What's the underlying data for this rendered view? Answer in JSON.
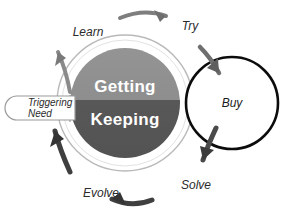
{
  "diagram": {
    "type": "cycle",
    "core": {
      "top_half_label": "Getting",
      "bottom_half_label": "Keeping",
      "top_half_color": "#8d8d8d",
      "bottom_half_color": "#585858",
      "label_color": "#ffffff",
      "ring_color": "#ffffff",
      "outer_ring_color": "#b5b5b5"
    },
    "callout": {
      "line1": "Triggering",
      "line2": "Need",
      "fill": "#ffffff",
      "stroke": "#9a9a9a"
    },
    "stages": [
      {
        "label": "Learn",
        "name": "stage-learn"
      },
      {
        "label": "Try",
        "name": "stage-try"
      },
      {
        "label": "Buy",
        "name": "stage-buy"
      },
      {
        "label": "Solve",
        "name": "stage-solve"
      },
      {
        "label": "Evolve",
        "name": "stage-evolve"
      }
    ],
    "buy_circle": {
      "label": "Buy",
      "fill": "#ffffff",
      "stroke": "#0c0c0c"
    },
    "arrows": {
      "color_light": "#8c8c8c",
      "color_dark": "#3a3a3a",
      "direction": "clockwise"
    }
  }
}
